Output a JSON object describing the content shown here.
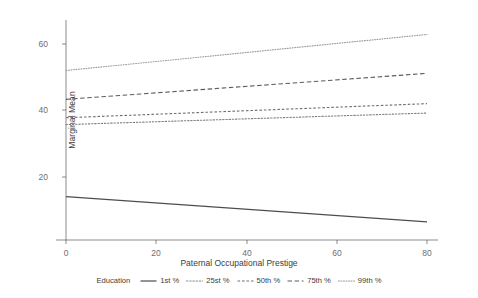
{
  "chart_data": {
    "type": "line",
    "title": "",
    "xlabel": "Paternal Occupational Prestige",
    "ylabel": "Marginal Mean",
    "xlim": [
      -4,
      84
    ],
    "ylim": [
      5,
      66
    ],
    "xticks": [
      0,
      20,
      40,
      60,
      80
    ],
    "yticks": [
      20,
      40,
      60
    ],
    "grid": false,
    "legend_position": "bottom",
    "legend_title": "Education",
    "x": [
      0,
      80
    ],
    "series": [
      {
        "name": "1st %",
        "values": [
          17.0,
          10.0
        ],
        "style": "solid",
        "color": "#4d4d4d"
      },
      {
        "name": "25st %",
        "values": [
          37.0,
          40.2
        ],
        "style": "dotted",
        "color": "#808080"
      },
      {
        "name": "50th %",
        "values": [
          38.9,
          42.8
        ],
        "style": "dotdash",
        "color": "#6e6e6e"
      },
      {
        "name": "75th %",
        "values": [
          44.0,
          51.2
        ],
        "style": "dashed",
        "color": "#5c5c5c"
      },
      {
        "name": "99th %",
        "values": [
          52.0,
          62.0
        ],
        "style": "finedot",
        "color": "#9a9a9a"
      }
    ]
  },
  "axes": {
    "y_title": "Marginal Mean",
    "x_title": "Paternal Occupational Prestige",
    "y_tick_labels": [
      "20",
      "40",
      "60"
    ],
    "x_tick_labels": [
      "0",
      "20",
      "40",
      "60",
      "80"
    ]
  },
  "legend": {
    "title": "Education",
    "items": [
      {
        "label": "1st %"
      },
      {
        "label": "25st %"
      },
      {
        "label": "50th %"
      },
      {
        "label": "75th %"
      },
      {
        "label": "99th %"
      }
    ]
  }
}
